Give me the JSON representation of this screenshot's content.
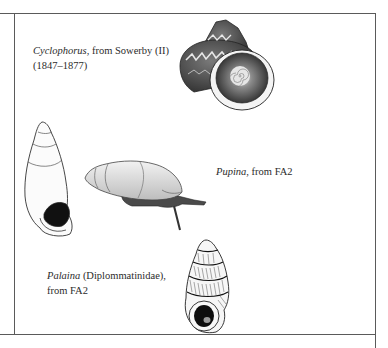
{
  "figure": {
    "captions": [
      {
        "genus": "Cyclophorus",
        "rest_line1": ", from Sowerby (II)",
        "line2": "(1847–1877)"
      },
      {
        "genus": "Pupina",
        "rest_line1": ", from FA2"
      },
      {
        "genus": "Palaina",
        "rest_line1": " (Diplommatinidae),",
        "line2": "from FA2"
      }
    ],
    "illustrations": [
      "cyclophorus-shell",
      "tall-conical-shell",
      "pupina-snail-with-body",
      "palaina-ribbed-shell"
    ]
  }
}
